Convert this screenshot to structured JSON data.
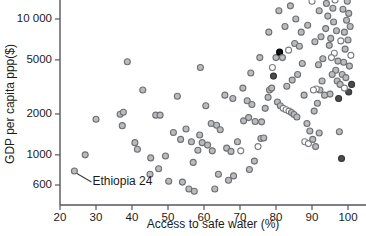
{
  "chart_data": {
    "type": "scatter",
    "title": "",
    "xlabel": "Access to safe water (%)",
    "ylabel": "GDP per capita ppp($)",
    "xlim": [
      20,
      105
    ],
    "ylim": [
      520,
      21000
    ],
    "yscale": "log",
    "xscale": "linear",
    "grid": false,
    "legend": "none",
    "xticks": [
      20,
      30,
      40,
      50,
      60,
      70,
      80,
      90,
      100
    ],
    "xtick_labels": [
      "20",
      "30",
      "40",
      "50",
      "60",
      "70",
      "80",
      "90",
      "100"
    ],
    "yticks": [
      600,
      1000,
      2000,
      5000,
      10000
    ],
    "ytick_labels": [
      "600",
      "1000",
      "2000",
      "5000",
      "10 000"
    ],
    "annotations": [
      {
        "label": "Ethiopia 24",
        "point_x": 24,
        "point_y": 760,
        "text_x": 29,
        "text_y": 600
      }
    ],
    "marker_styles": {
      "grey": "grey filled circle",
      "open": "hollow white circle",
      "dark": "dark grey filled circle",
      "black": "black filled circle"
    },
    "points": [
      {
        "x": 24.0,
        "y": 760,
        "m": "grey"
      },
      {
        "x": 27.0,
        "y": 1000,
        "m": "grey"
      },
      {
        "x": 30.0,
        "y": 1830,
        "m": "grey"
      },
      {
        "x": 36.7,
        "y": 1990,
        "m": "grey"
      },
      {
        "x": 37.6,
        "y": 2060,
        "m": "grey"
      },
      {
        "x": 37.3,
        "y": 1640,
        "m": "grey"
      },
      {
        "x": 40.8,
        "y": 1230,
        "m": "grey"
      },
      {
        "x": 41.5,
        "y": 1100,
        "m": "grey"
      },
      {
        "x": 45.2,
        "y": 950,
        "m": "grey"
      },
      {
        "x": 45.0,
        "y": 720,
        "m": "grey"
      },
      {
        "x": 46.6,
        "y": 1960,
        "m": "grey"
      },
      {
        "x": 47.8,
        "y": 1960,
        "m": "grey"
      },
      {
        "x": 47.4,
        "y": 790,
        "m": "grey"
      },
      {
        "x": 49.3,
        "y": 980,
        "m": "grey"
      },
      {
        "x": 43.0,
        "y": 3000,
        "m": "grey"
      },
      {
        "x": 38.7,
        "y": 4850,
        "m": "grey"
      },
      {
        "x": 51.5,
        "y": 1460,
        "m": "grey"
      },
      {
        "x": 52.6,
        "y": 2700,
        "m": "grey"
      },
      {
        "x": 50.2,
        "y": 640,
        "m": "grey"
      },
      {
        "x": 54.0,
        "y": 630,
        "m": "grey"
      },
      {
        "x": 55.8,
        "y": 560,
        "m": "grey"
      },
      {
        "x": 57.3,
        "y": 540,
        "m": "grey"
      },
      {
        "x": 57.0,
        "y": 880,
        "m": "grey"
      },
      {
        "x": 58.3,
        "y": 1080,
        "m": "grey"
      },
      {
        "x": 59.5,
        "y": 1230,
        "m": "grey"
      },
      {
        "x": 61.0,
        "y": 1180,
        "m": "grey"
      },
      {
        "x": 62.3,
        "y": 1070,
        "m": "grey"
      },
      {
        "x": 62.0,
        "y": 1700,
        "m": "grey"
      },
      {
        "x": 63.5,
        "y": 1650,
        "m": "grey"
      },
      {
        "x": 64.5,
        "y": 1530,
        "m": "grey"
      },
      {
        "x": 60.5,
        "y": 2300,
        "m": "grey"
      },
      {
        "x": 59.0,
        "y": 4400,
        "m": "grey"
      },
      {
        "x": 66.3,
        "y": 1120,
        "m": "grey"
      },
      {
        "x": 67.5,
        "y": 1060,
        "m": "grey"
      },
      {
        "x": 68.2,
        "y": 700,
        "m": "grey"
      },
      {
        "x": 69.3,
        "y": 1250,
        "m": "grey"
      },
      {
        "x": 70.2,
        "y": 1070,
        "m": "open"
      },
      {
        "x": 71.0,
        "y": 1780,
        "m": "grey"
      },
      {
        "x": 72.4,
        "y": 1880,
        "m": "grey"
      },
      {
        "x": 72.0,
        "y": 2500,
        "m": "grey"
      },
      {
        "x": 73.3,
        "y": 2350,
        "m": "grey"
      },
      {
        "x": 74.2,
        "y": 1760,
        "m": "grey"
      },
      {
        "x": 75.0,
        "y": 1150,
        "m": "open"
      },
      {
        "x": 75.8,
        "y": 1320,
        "m": "grey"
      },
      {
        "x": 76.6,
        "y": 1330,
        "m": "grey"
      },
      {
        "x": 77.0,
        "y": 2200,
        "m": "grey"
      },
      {
        "x": 77.8,
        "y": 2650,
        "m": "grey"
      },
      {
        "x": 78.2,
        "y": 3000,
        "m": "grey"
      },
      {
        "x": 78.8,
        "y": 3100,
        "m": "grey"
      },
      {
        "x": 79.3,
        "y": 3800,
        "m": "dark"
      },
      {
        "x": 79.0,
        "y": 4400,
        "m": "open"
      },
      {
        "x": 80.0,
        "y": 5200,
        "m": "grey"
      },
      {
        "x": 81.0,
        "y": 5700,
        "m": "black"
      },
      {
        "x": 81.8,
        "y": 5200,
        "m": "grey"
      },
      {
        "x": 80.4,
        "y": 2450,
        "m": "grey"
      },
      {
        "x": 81.2,
        "y": 2300,
        "m": "grey"
      },
      {
        "x": 82.0,
        "y": 2200,
        "m": "open"
      },
      {
        "x": 82.8,
        "y": 2150,
        "m": "open"
      },
      {
        "x": 83.6,
        "y": 2100,
        "m": "open"
      },
      {
        "x": 84.3,
        "y": 2050,
        "m": "grey"
      },
      {
        "x": 85.0,
        "y": 1980,
        "m": "grey"
      },
      {
        "x": 85.8,
        "y": 1900,
        "m": "grey"
      },
      {
        "x": 83.0,
        "y": 3200,
        "m": "grey"
      },
      {
        "x": 84.5,
        "y": 3550,
        "m": "grey"
      },
      {
        "x": 83.5,
        "y": 5900,
        "m": "open"
      },
      {
        "x": 85.2,
        "y": 6600,
        "m": "grey"
      },
      {
        "x": 86.5,
        "y": 6300,
        "m": "grey"
      },
      {
        "x": 87.3,
        "y": 4700,
        "m": "grey"
      },
      {
        "x": 86.0,
        "y": 3900,
        "m": "grey"
      },
      {
        "x": 87.8,
        "y": 2750,
        "m": "grey"
      },
      {
        "x": 88.6,
        "y": 1700,
        "m": "grey"
      },
      {
        "x": 89.4,
        "y": 1500,
        "m": "grey"
      },
      {
        "x": 88.0,
        "y": 1250,
        "m": "open"
      },
      {
        "x": 89.0,
        "y": 1210,
        "m": "open"
      },
      {
        "x": 90.2,
        "y": 1300,
        "m": "grey"
      },
      {
        "x": 91.0,
        "y": 1150,
        "m": "grey"
      },
      {
        "x": 90.6,
        "y": 2100,
        "m": "grey"
      },
      {
        "x": 91.5,
        "y": 2400,
        "m": "grey"
      },
      {
        "x": 92.2,
        "y": 3000,
        "m": "grey"
      },
      {
        "x": 92.8,
        "y": 3500,
        "m": "grey"
      },
      {
        "x": 91.8,
        "y": 4600,
        "m": "grey"
      },
      {
        "x": 93.0,
        "y": 5100,
        "m": "grey"
      },
      {
        "x": 90.8,
        "y": 6800,
        "m": "grey"
      },
      {
        "x": 92.5,
        "y": 7400,
        "m": "grey"
      },
      {
        "x": 93.8,
        "y": 8500,
        "m": "grey"
      },
      {
        "x": 94.4,
        "y": 10500,
        "m": "grey"
      },
      {
        "x": 92.0,
        "y": 11500,
        "m": "grey"
      },
      {
        "x": 90.0,
        "y": 13500,
        "m": "open"
      },
      {
        "x": 88.2,
        "y": 15500,
        "m": "grey"
      },
      {
        "x": 94.0,
        "y": 13000,
        "m": "grey"
      },
      {
        "x": 95.0,
        "y": 15000,
        "m": "grey"
      },
      {
        "x": 95.8,
        "y": 12000,
        "m": "grey"
      },
      {
        "x": 96.4,
        "y": 13800,
        "m": "open"
      },
      {
        "x": 96.0,
        "y": 9500,
        "m": "grey"
      },
      {
        "x": 96.8,
        "y": 8200,
        "m": "grey"
      },
      {
        "x": 95.2,
        "y": 7200,
        "m": "grey"
      },
      {
        "x": 94.8,
        "y": 6400,
        "m": "grey"
      },
      {
        "x": 96.2,
        "y": 5600,
        "m": "open"
      },
      {
        "x": 95.4,
        "y": 5200,
        "m": "open"
      },
      {
        "x": 97.2,
        "y": 4900,
        "m": "grey"
      },
      {
        "x": 96.6,
        "y": 4200,
        "m": "grey"
      },
      {
        "x": 95.6,
        "y": 3900,
        "m": "grey"
      },
      {
        "x": 97.0,
        "y": 3500,
        "m": "grey"
      },
      {
        "x": 97.8,
        "y": 3300,
        "m": "grey"
      },
      {
        "x": 98.4,
        "y": 3900,
        "m": "grey"
      },
      {
        "x": 98.8,
        "y": 4800,
        "m": "grey"
      },
      {
        "x": 99.2,
        "y": 6000,
        "m": "grey"
      },
      {
        "x": 98.0,
        "y": 6900,
        "m": "open"
      },
      {
        "x": 99.0,
        "y": 8000,
        "m": "grey"
      },
      {
        "x": 99.6,
        "y": 9800,
        "m": "grey"
      },
      {
        "x": 98.6,
        "y": 11800,
        "m": "grey"
      },
      {
        "x": 99.8,
        "y": 13500,
        "m": "grey"
      },
      {
        "x": 100.2,
        "y": 11000,
        "m": "grey"
      },
      {
        "x": 100.6,
        "y": 8800,
        "m": "grey"
      },
      {
        "x": 100.0,
        "y": 7000,
        "m": "grey"
      },
      {
        "x": 100.8,
        "y": 5400,
        "m": "open"
      },
      {
        "x": 100.4,
        "y": 4500,
        "m": "grey"
      },
      {
        "x": 99.4,
        "y": 3700,
        "m": "grey"
      },
      {
        "x": 100.2,
        "y": 2900,
        "m": "dark"
      },
      {
        "x": 101.0,
        "y": 3300,
        "m": "dark"
      },
      {
        "x": 97.4,
        "y": 2600,
        "m": "dark"
      },
      {
        "x": 99.0,
        "y": 3100,
        "m": "open"
      },
      {
        "x": 95.0,
        "y": 2800,
        "m": "grey"
      },
      {
        "x": 93.5,
        "y": 2750,
        "m": "grey"
      },
      {
        "x": 91.2,
        "y": 3050,
        "m": "open"
      },
      {
        "x": 90.4,
        "y": 3000,
        "m": "open"
      },
      {
        "x": 92.0,
        "y": 1450,
        "m": "grey"
      },
      {
        "x": 97.6,
        "y": 1480,
        "m": "grey"
      },
      {
        "x": 98.2,
        "y": 940,
        "m": "dark"
      },
      {
        "x": 86.8,
        "y": 16500,
        "m": "grey"
      },
      {
        "x": 89.6,
        "y": 17500,
        "m": "open"
      },
      {
        "x": 93.2,
        "y": 17000,
        "m": "grey"
      },
      {
        "x": 96.0,
        "y": 18000,
        "m": "grey"
      },
      {
        "x": 99.0,
        "y": 17500,
        "m": "grey"
      },
      {
        "x": 101.2,
        "y": 16000,
        "m": "grey"
      },
      {
        "x": 88.8,
        "y": 9000,
        "m": "grey"
      },
      {
        "x": 87.0,
        "y": 8000,
        "m": "grey"
      },
      {
        "x": 85.5,
        "y": 10000,
        "m": "grey"
      },
      {
        "x": 82.5,
        "y": 8800,
        "m": "grey"
      },
      {
        "x": 80.8,
        "y": 11500,
        "m": "grey"
      },
      {
        "x": 84.0,
        "y": 12500,
        "m": "grey"
      },
      {
        "x": 78.0,
        "y": 8000,
        "m": "grey"
      },
      {
        "x": 75.5,
        "y": 5200,
        "m": "grey"
      },
      {
        "x": 73.0,
        "y": 4000,
        "m": "grey"
      },
      {
        "x": 70.8,
        "y": 3100,
        "m": "grey"
      },
      {
        "x": 68.0,
        "y": 2600,
        "m": "grey"
      },
      {
        "x": 65.8,
        "y": 2750,
        "m": "grey"
      },
      {
        "x": 76.0,
        "y": 1750,
        "m": "grey"
      },
      {
        "x": 74.0,
        "y": 900,
        "m": "grey"
      },
      {
        "x": 72.6,
        "y": 780,
        "m": "grey"
      },
      {
        "x": 63.0,
        "y": 560,
        "m": "grey"
      },
      {
        "x": 64.0,
        "y": 720,
        "m": "grey"
      },
      {
        "x": 66.8,
        "y": 650,
        "m": "grey"
      },
      {
        "x": 55.0,
        "y": 1550,
        "m": "grey"
      },
      {
        "x": 53.5,
        "y": 1300,
        "m": "grey"
      },
      {
        "x": 56.5,
        "y": 1250,
        "m": "grey"
      },
      {
        "x": 58.8,
        "y": 1400,
        "m": "grey"
      }
    ]
  }
}
